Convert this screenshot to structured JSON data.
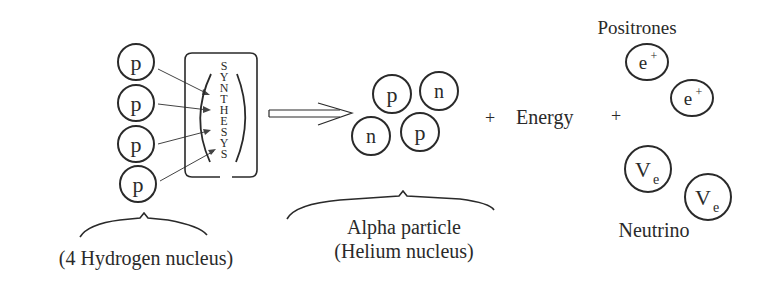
{
  "diagram": {
    "reactants": {
      "particles": [
        {
          "label": "p",
          "cx": 136,
          "cy": 62
        },
        {
          "label": "p",
          "cx": 136,
          "cy": 103
        },
        {
          "label": "p",
          "cx": 136,
          "cy": 144
        },
        {
          "label": "p",
          "cx": 138,
          "cy": 184
        }
      ],
      "caption": "(4 Hydrogen nucleus)"
    },
    "process": {
      "letters": [
        "S",
        "Y",
        "N",
        "T",
        "H",
        "E",
        "S",
        "Y",
        "S"
      ],
      "word": "SYNTHESYS"
    },
    "products": {
      "alpha": {
        "particles": [
          {
            "label": "p",
            "cx": 392,
            "cy": 94
          },
          {
            "label": "n",
            "cx": 439,
            "cy": 91
          },
          {
            "label": "n",
            "cx": 371,
            "cy": 136
          },
          {
            "label": "p",
            "cx": 420,
            "cy": 132
          }
        ],
        "caption_line1": "Alpha particle",
        "caption_line2": "(Helium nucleus)"
      },
      "plus1": "+",
      "energy": "Energy",
      "plus2": "+",
      "positrons": {
        "title": "Positrones",
        "particles": [
          {
            "base": "e",
            "sup": "+",
            "cx": 647,
            "cy": 62
          },
          {
            "base": "e",
            "sup": "+",
            "cx": 692,
            "cy": 98
          }
        ]
      },
      "neutrinos": {
        "title": "Neutrino",
        "particles": [
          {
            "base": "V",
            "sub": "e",
            "cx": 648,
            "cy": 169
          },
          {
            "base": "V",
            "sub": "e",
            "cx": 708,
            "cy": 197
          }
        ]
      }
    },
    "colors": {
      "ink": "#2a2a2a",
      "background": "#ffffff"
    }
  }
}
